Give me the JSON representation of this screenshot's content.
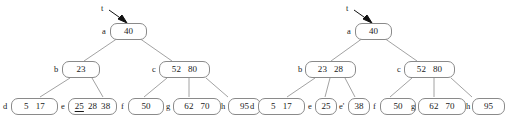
{
  "figure": {
    "background": "#ffffff",
    "node_border_color": "#8a8a8a",
    "edge_color": "#8a8a8a",
    "text_color": "#1a1a1a"
  },
  "trees": [
    {
      "id": "before",
      "root_pointer_label": "t",
      "nodes": [
        {
          "id": "a",
          "label": "a",
          "keys": [
            "40"
          ],
          "underlined": []
        },
        {
          "id": "b",
          "label": "b",
          "keys": [
            "23"
          ],
          "underlined": []
        },
        {
          "id": "c",
          "label": "c",
          "keys": [
            "52",
            "80"
          ],
          "underlined": []
        },
        {
          "id": "d",
          "label": "d",
          "keys": [
            "5",
            "17"
          ],
          "underlined": []
        },
        {
          "id": "e",
          "label": "e",
          "keys": [
            "25",
            "28",
            "38"
          ],
          "underlined": [
            "25"
          ]
        },
        {
          "id": "f",
          "label": "f",
          "keys": [
            "50"
          ],
          "underlined": []
        },
        {
          "id": "g",
          "label": "g",
          "keys": [
            "62",
            "70"
          ],
          "underlined": []
        },
        {
          "id": "h",
          "label": "h",
          "keys": [
            "95"
          ],
          "underlined": []
        }
      ],
      "edges": [
        {
          "from": "a",
          "to": "b"
        },
        {
          "from": "a",
          "to": "c"
        },
        {
          "from": "b",
          "to": "d"
        },
        {
          "from": "b",
          "to": "e"
        },
        {
          "from": "c",
          "to": "f"
        },
        {
          "from": "c",
          "to": "g"
        },
        {
          "from": "c",
          "to": "h"
        }
      ]
    },
    {
      "id": "after",
      "root_pointer_label": "t",
      "nodes": [
        {
          "id": "a2",
          "label": "a",
          "keys": [
            "40"
          ],
          "underlined": []
        },
        {
          "id": "b2",
          "label": "b",
          "keys": [
            "23",
            "28"
          ],
          "underlined": []
        },
        {
          "id": "c2",
          "label": "c",
          "keys": [
            "52",
            "80"
          ],
          "underlined": []
        },
        {
          "id": "d2",
          "label": "d",
          "keys": [
            "5",
            "17"
          ],
          "underlined": []
        },
        {
          "id": "e2",
          "label": "e",
          "keys": [
            "25"
          ],
          "underlined": []
        },
        {
          "id": "ep2",
          "label": "e'",
          "keys": [
            "38"
          ],
          "underlined": []
        },
        {
          "id": "f2",
          "label": "f",
          "keys": [
            "50"
          ],
          "underlined": []
        },
        {
          "id": "g2",
          "label": "g",
          "keys": [
            "62",
            "70"
          ],
          "underlined": []
        },
        {
          "id": "h2",
          "label": "h",
          "keys": [
            "95"
          ],
          "underlined": []
        }
      ],
      "edges": [
        {
          "from": "a2",
          "to": "b2"
        },
        {
          "from": "a2",
          "to": "c2"
        },
        {
          "from": "b2",
          "to": "d2"
        },
        {
          "from": "b2",
          "to": "e2"
        },
        {
          "from": "b2",
          "to": "ep2"
        },
        {
          "from": "c2",
          "to": "f2"
        },
        {
          "from": "c2",
          "to": "g2"
        },
        {
          "from": "c2",
          "to": "h2"
        }
      ]
    }
  ]
}
